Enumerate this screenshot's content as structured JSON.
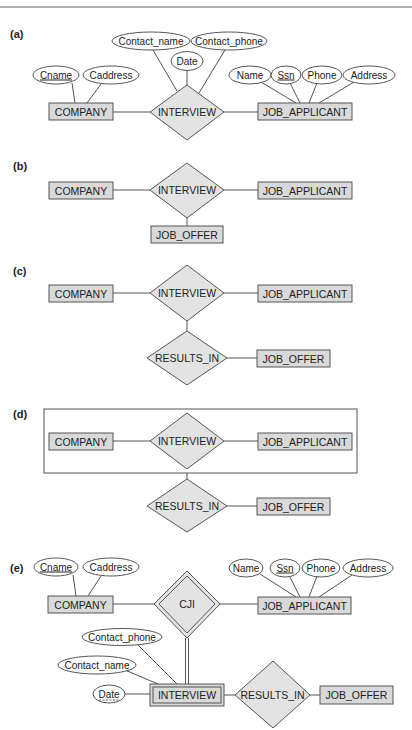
{
  "diagram": {
    "panels": [
      {
        "label": "(a)",
        "entities": [
          "COMPANY",
          "JOB_APPLICANT"
        ],
        "relationships": [
          "INTERVIEW"
        ],
        "company_attrs": [
          "Cname",
          "Caddress"
        ],
        "relationship_attrs": [
          "Contact_name",
          "Date",
          "Contact_phone"
        ],
        "applicant_attrs": [
          "Name",
          "Ssn",
          "Phone",
          "Address"
        ],
        "key_attrs": [
          "Cname",
          "Ssn"
        ]
      },
      {
        "label": "(b)",
        "entities": [
          "COMPANY",
          "JOB_APPLICANT",
          "JOB_OFFER"
        ],
        "relationships": [
          "INTERVIEW"
        ]
      },
      {
        "label": "(c)",
        "entities": [
          "COMPANY",
          "JOB_APPLICANT",
          "JOB_OFFER"
        ],
        "relationships": [
          "INTERVIEW",
          "RESULTS_IN"
        ]
      },
      {
        "label": "(d)",
        "entities": [
          "COMPANY",
          "JOB_APPLICANT",
          "JOB_OFFER"
        ],
        "relationships": [
          "INTERVIEW",
          "RESULTS_IN"
        ],
        "aggregation_box": true
      },
      {
        "label": "(e)",
        "entities": [
          "COMPANY",
          "JOB_APPLICANT",
          "JOB_OFFER"
        ],
        "weak_entities": [
          "INTERVIEW"
        ],
        "identifying_relationships": [
          "CJI"
        ],
        "relationships": [
          "RESULTS_IN"
        ],
        "company_attrs": [
          "Cname",
          "Caddress"
        ],
        "applicant_attrs": [
          "Name",
          "Ssn",
          "Phone",
          "Address"
        ],
        "interview_attrs": [
          "Contact_phone",
          "Contact_name",
          "Date"
        ],
        "key_attrs": [
          "Cname",
          "Ssn"
        ],
        "partial_key_attrs": [
          "Date"
        ]
      }
    ]
  },
  "text": {
    "a": {
      "label": "(a)",
      "company": "COMPANY",
      "interview": "INTERVIEW",
      "applicant": "JOB_APPLICANT",
      "cname": "Cname",
      "caddress": "Caddress",
      "contact_name": "Contact_name",
      "contact_phone": "Contact_phone",
      "date": "Date",
      "name": "Name",
      "ssn": "Ssn",
      "phone": "Phone",
      "address": "Address"
    },
    "b": {
      "label": "(b)",
      "company": "COMPANY",
      "interview": "INTERVIEW",
      "applicant": "JOB_APPLICANT",
      "offer": "JOB_OFFER"
    },
    "c": {
      "label": "(c)",
      "company": "COMPANY",
      "interview": "INTERVIEW",
      "applicant": "JOB_APPLICANT",
      "results": "RESULTS_IN",
      "offer": "JOB_OFFER"
    },
    "d": {
      "label": "(d)",
      "company": "COMPANY",
      "interview": "INTERVIEW",
      "applicant": "JOB_APPLICANT",
      "results": "RESULTS_IN",
      "offer": "JOB_OFFER"
    },
    "e": {
      "label": "(e)",
      "company": "COMPANY",
      "cji": "CJI",
      "applicant": "JOB_APPLICANT",
      "interview": "INTERVIEW",
      "results": "RESULTS_IN",
      "offer": "JOB_OFFER",
      "cname": "Cname",
      "caddress": "Caddress",
      "name": "Name",
      "ssn": "Ssn",
      "phone": "Phone",
      "address": "Address",
      "contact_phone": "Contact_phone",
      "contact_name": "Contact_name",
      "date": "Date"
    }
  },
  "colors": {
    "entity_fill": "#d9d9d9",
    "relationship_fill": "#e3e3e3",
    "stroke": "#555555",
    "background": "#ffffff"
  }
}
